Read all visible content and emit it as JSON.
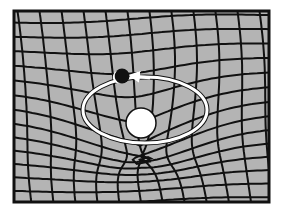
{
  "diagram": {
    "colors": {
      "background": "#ffffff",
      "grid_fill": "#b4b4b4",
      "grid_lines": "#111111",
      "frame": "#111111",
      "orbit": "#ffffff",
      "central_mass": "#ffffff",
      "orbiting_body": "#111111"
    },
    "frame": {
      "x": 14,
      "y": 11,
      "width": 255,
      "height": 191
    },
    "central_mass": {
      "cx": 141,
      "cy": 123,
      "r": 15
    },
    "orbit": {
      "cx": 145,
      "cy": 110,
      "rx": 62,
      "ry": 33,
      "direction": "counterclockwise"
    },
    "orbiting_body": {
      "cx": 122,
      "cy": 76,
      "r": 7
    },
    "well_center": {
      "x": 141,
      "y": 118
    }
  }
}
